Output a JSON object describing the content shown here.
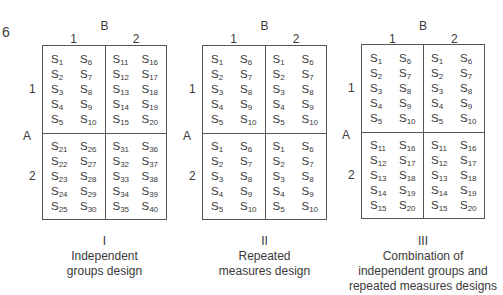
{
  "figure_number": "6",
  "factor_b": "B",
  "factor_a": "A",
  "levels": [
    "1",
    "2"
  ],
  "designs": [
    {
      "numeral": "I",
      "caption": [
        "Independent",
        "groups design"
      ],
      "cells": {
        "a1b1": [
          [
            "1",
            "2",
            "3",
            "4",
            "5"
          ],
          [
            "6",
            "7",
            "8",
            "9",
            "10"
          ]
        ],
        "a1b2": [
          [
            "11",
            "12",
            "13",
            "14",
            "15"
          ],
          [
            "16",
            "17",
            "18",
            "19",
            "20"
          ]
        ],
        "a2b1": [
          [
            "21",
            "22",
            "23",
            "24",
            "25"
          ],
          [
            "26",
            "27",
            "28",
            "29",
            "30"
          ]
        ],
        "a2b2": [
          [
            "31",
            "32",
            "33",
            "34",
            "35"
          ],
          [
            "36",
            "37",
            "38",
            "39",
            "40"
          ]
        ]
      }
    },
    {
      "numeral": "II",
      "caption": [
        "Repeated",
        "measures design"
      ],
      "cells": {
        "a1b1": [
          [
            "1",
            "2",
            "3",
            "4",
            "5"
          ],
          [
            "6",
            "7",
            "8",
            "9",
            "10"
          ]
        ],
        "a1b2": [
          [
            "1",
            "2",
            "3",
            "4",
            "5"
          ],
          [
            "6",
            "7",
            "8",
            "9",
            "10"
          ]
        ],
        "a2b1": [
          [
            "1",
            "2",
            "3",
            "4",
            "5"
          ],
          [
            "6",
            "7",
            "8",
            "9",
            "10"
          ]
        ],
        "a2b2": [
          [
            "1",
            "2",
            "3",
            "4",
            "5"
          ],
          [
            "6",
            "7",
            "8",
            "9",
            "10"
          ]
        ]
      }
    },
    {
      "numeral": "III",
      "caption": [
        "Combination of",
        "independent groups and",
        "repeated measures designs"
      ],
      "cells": {
        "a1b1": [
          [
            "1",
            "2",
            "3",
            "4",
            "5"
          ],
          [
            "6",
            "7",
            "8",
            "9",
            "10"
          ]
        ],
        "a1b2": [
          [
            "1",
            "2",
            "3",
            "4",
            "5"
          ],
          [
            "6",
            "7",
            "8",
            "9",
            "10"
          ]
        ],
        "a2b1": [
          [
            "11",
            "12",
            "13",
            "14",
            "15"
          ],
          [
            "16",
            "17",
            "18",
            "19",
            "20"
          ]
        ],
        "a2b2": [
          [
            "11",
            "12",
            "13",
            "14",
            "15"
          ],
          [
            "16",
            "17",
            "18",
            "19",
            "20"
          ]
        ]
      }
    }
  ],
  "subject_prefix": "S"
}
